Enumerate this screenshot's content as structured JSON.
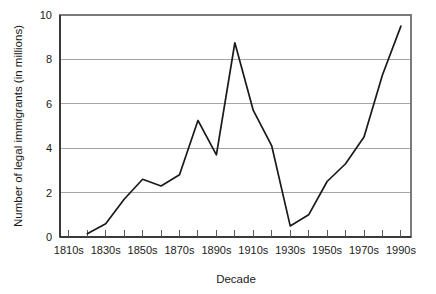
{
  "chart_data": {
    "type": "line",
    "title": "",
    "xlabel": "Decade",
    "ylabel": "Number of legal immigrants (in millions)",
    "categories": [
      "1810s",
      "1820s",
      "1830s",
      "1840s",
      "1850s",
      "1860s",
      "1870s",
      "1880s",
      "1890s",
      "1900s",
      "1910s",
      "1920s",
      "1930s",
      "1940s",
      "1950s",
      "1960s",
      "1970s",
      "1980s",
      "1990s"
    ],
    "x_tick_labels": [
      "1810s",
      "1830s",
      "1850s",
      "1870s",
      "1890s",
      "1910s",
      "1930s",
      "1950s",
      "1970s",
      "1990s"
    ],
    "y_tick_labels": [
      "0",
      "2",
      "4",
      "6",
      "8",
      "10"
    ],
    "y_ticks": [
      0,
      2,
      4,
      6,
      8,
      10
    ],
    "ylim": [
      0,
      10
    ],
    "grid": "horizontal",
    "legend": "none",
    "series": [
      {
        "name": "Legal immigrants",
        "points": [
          {
            "x": "1820s",
            "y": 0.15
          },
          {
            "x": "1830s",
            "y": 0.6
          },
          {
            "x": "1840s",
            "y": 1.7
          },
          {
            "x": "1850s",
            "y": 2.6
          },
          {
            "x": "1860s",
            "y": 2.3
          },
          {
            "x": "1870s",
            "y": 2.8
          },
          {
            "x": "1880s",
            "y": 5.25
          },
          {
            "x": "1890s",
            "y": 3.7
          },
          {
            "x": "1900s",
            "y": 8.75
          },
          {
            "x": "1910s",
            "y": 5.7
          },
          {
            "x": "1920s",
            "y": 4.1
          },
          {
            "x": "1930s",
            "y": 0.5
          },
          {
            "x": "1940s",
            "y": 1.0
          },
          {
            "x": "1950s",
            "y": 2.5
          },
          {
            "x": "1960s",
            "y": 3.3
          },
          {
            "x": "1970s",
            "y": 4.5
          },
          {
            "x": "1980s",
            "y": 7.3
          },
          {
            "x": "1990s",
            "y": 9.5
          }
        ]
      }
    ],
    "colors": {
      "line": "#1a1a1a",
      "grid": "#a6a6a6",
      "frame": "#7a7a7a",
      "background": "#ffffff",
      "text": "#1a1a1a"
    }
  }
}
